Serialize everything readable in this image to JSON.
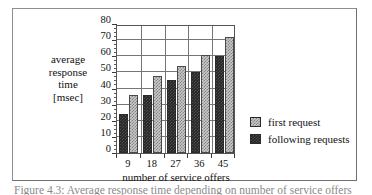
{
  "figure": {
    "caption": "Figure 4.3:  Average response time depending on number of service offers"
  },
  "chart_data": {
    "type": "bar",
    "title": "",
    "xlabel": "number of service offers",
    "ylabel": "average response time [msec]",
    "ylabel_lines": [
      "average",
      "response",
      "time",
      "[msec]"
    ],
    "categories": [
      "9",
      "18",
      "27",
      "36",
      "45"
    ],
    "series": [
      {
        "name": "following requests",
        "color": "#242424",
        "values": [
          24,
          36,
          45,
          50,
          60
        ]
      },
      {
        "name": "first request",
        "color": "#c9c9c9",
        "values": [
          36,
          48,
          54,
          61,
          72
        ]
      }
    ],
    "ylim": [
      0,
      80
    ],
    "ytick_step": 10,
    "yticks": [
      "80",
      "70",
      "60",
      "50",
      "40",
      "30",
      "20",
      "10",
      "0"
    ],
    "yminor_step": 2.5,
    "grid": "horizontal-and-vertical",
    "legend_position": "right-middle",
    "legend_order": [
      "first request",
      "following requests"
    ]
  }
}
